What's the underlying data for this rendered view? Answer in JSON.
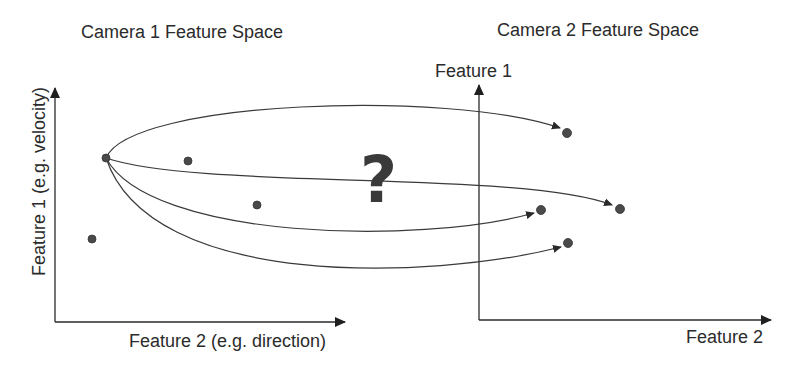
{
  "camera1": {
    "title": "Camera 1 Feature Space",
    "y_axis_label": "Feature 1 (e.g. velocity)",
    "x_axis_label": "Feature 2 (e.g. direction)",
    "points": [
      {
        "x": 106,
        "y": 158,
        "role": "source"
      },
      {
        "x": 188,
        "y": 161
      },
      {
        "x": 257,
        "y": 205
      },
      {
        "x": 92,
        "y": 239
      }
    ]
  },
  "camera2": {
    "title": "Camera 2 Feature Space",
    "y_axis_label": "Feature 1",
    "x_axis_label": "Feature 2",
    "points": [
      {
        "x": 567,
        "y": 133
      },
      {
        "x": 620,
        "y": 209
      },
      {
        "x": 541,
        "y": 210
      },
      {
        "x": 568,
        "y": 243
      }
    ]
  },
  "question_mark": "?",
  "colors": {
    "line": "#3a3a3a",
    "point": "#4a4a4a",
    "text": "#2b2b2b"
  }
}
